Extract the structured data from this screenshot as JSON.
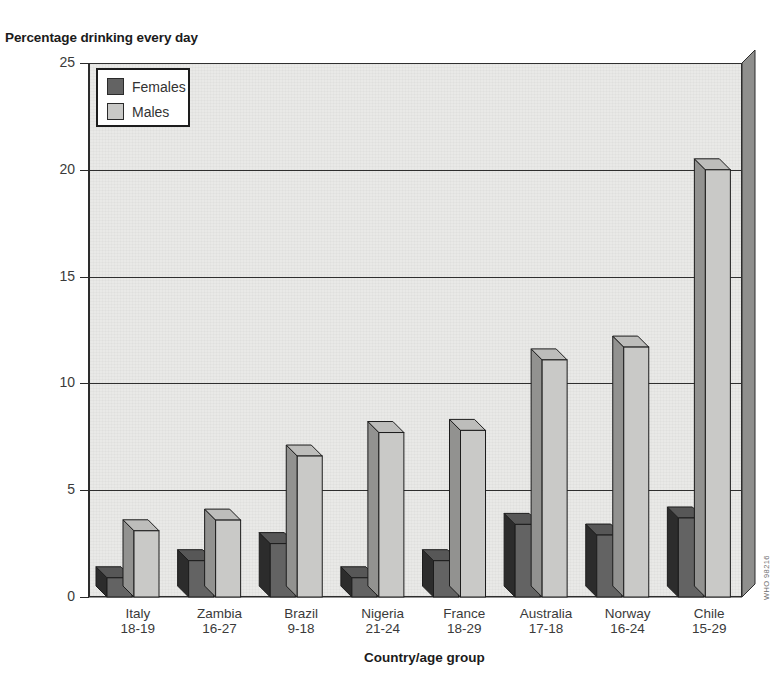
{
  "chart_data": {
    "type": "bar",
    "title": "Percentage drinking every day",
    "xlabel": "Country/age group",
    "ylabel": "",
    "ylim": [
      0,
      25
    ],
    "yticks": [
      0,
      5,
      10,
      15,
      20,
      25
    ],
    "grid": true,
    "legend_position": "top-left",
    "categories": [
      "Italy\n18-19",
      "Zambia\n16-27",
      "Brazil\n9-18",
      "Nigeria\n21-24",
      "France\n18-29",
      "Australia\n17-18",
      "Norway\n16-24",
      "Chile\n15-29"
    ],
    "country_labels": [
      "Italy",
      "Zambia",
      "Brazil",
      "Nigeria",
      "France",
      "Australia",
      "Norway",
      "Chile"
    ],
    "age_labels": [
      "18-19",
      "16-27",
      "9-18",
      "21-24",
      "18-29",
      "17-18",
      "16-24",
      "15-29"
    ],
    "series": [
      {
        "name": "Females",
        "color": "#636363",
        "values": [
          0.9,
          1.7,
          2.5,
          0.9,
          1.7,
          3.4,
          2.9,
          3.7
        ]
      },
      {
        "name": "Males",
        "color": "#c9c9c7",
        "values": [
          3.1,
          3.6,
          6.6,
          7.7,
          7.8,
          11.1,
          11.7,
          20.0
        ]
      }
    ]
  },
  "legend": {
    "entries": [
      {
        "label": "Females",
        "color": "#636363"
      },
      {
        "label": "Males",
        "color": "#c9c9c7"
      }
    ]
  },
  "watermark": {
    "text": "WHO 98216"
  },
  "colors": {
    "plot_background": "#e9e9e7",
    "females": "#636363",
    "males": "#c9c9c7",
    "axis": "#2d2d2d",
    "text": "#333333"
  }
}
